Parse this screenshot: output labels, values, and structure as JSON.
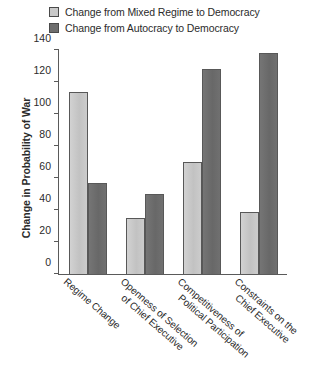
{
  "legend": {
    "items": [
      {
        "label": "Change from Mixed Regime to Democracy",
        "color": "#c9c9c9",
        "swatch": "light-gray-swatch"
      },
      {
        "label": "Change from Autocracy to Democracy",
        "color": "#6e6e6e",
        "swatch": "dark-gray-swatch"
      }
    ]
  },
  "axis": {
    "ylabel": "Change in Probability of War",
    "yticks": [
      "0",
      "20",
      "40",
      "60",
      "80",
      "100",
      "120",
      "140"
    ]
  },
  "categories": [
    {
      "line1": "Regime Change",
      "line2": ""
    },
    {
      "line1": "Openness of Selection",
      "line2": "of Chief Executive"
    },
    {
      "line1": "Competitiveness of",
      "line2": "Political Participation"
    },
    {
      "line1": "Constraints on the",
      "line2": "Chief Executive"
    }
  ],
  "chart_data": {
    "type": "bar",
    "title": "",
    "xlabel": "",
    "ylabel": "Change in Probability of War",
    "ylim": [
      0,
      140
    ],
    "ytick_step": 20,
    "grid": false,
    "legend_position": "top",
    "categories": [
      "Regime Change",
      "Openness of Selection of Chief Executive",
      "Competitiveness of Political Participation",
      "Constraints on the Chief Executive"
    ],
    "series": [
      {
        "name": "Change from Mixed Regime to Democracy",
        "color": "#c9c9c9",
        "values": [
          114,
          35,
          70,
          39
        ]
      },
      {
        "name": "Change from Autocracy to Democracy",
        "color": "#6e6e6e",
        "values": [
          57,
          50,
          128,
          138
        ]
      }
    ]
  }
}
